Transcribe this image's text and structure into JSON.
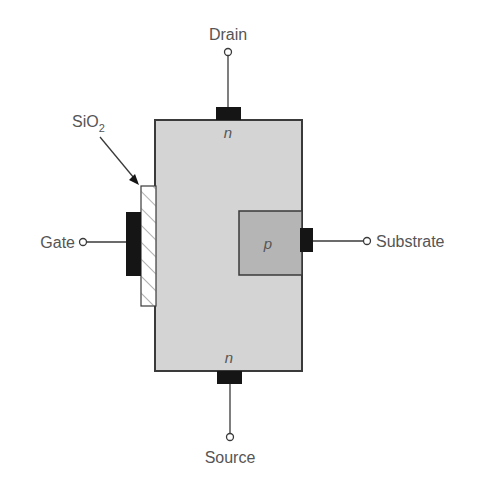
{
  "diagram": {
    "terminals": {
      "drain": "Drain",
      "source": "Source",
      "gate": "Gate",
      "substrate": "Substrate"
    },
    "oxide_label": {
      "base": "SiO",
      "subscript": "2"
    },
    "regions": {
      "drain_region": "n",
      "source_region": "n",
      "substrate_region": "p"
    },
    "colors": {
      "body_fill": "#d4d4d4",
      "p_region_fill": "#b5b5b5",
      "metal": "#151515",
      "outline": "#3a3a3a",
      "text": "#555555"
    }
  }
}
